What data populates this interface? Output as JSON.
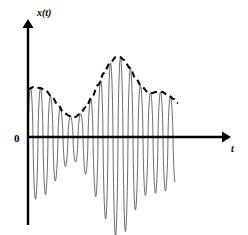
{
  "figure": {
    "title": "",
    "background_color": "#ffffff",
    "width": 248,
    "height": 235
  },
  "axes": {
    "y_axis_label": "x(t)",
    "x_axis_label": "t",
    "origin_label": "0",
    "axis_color": "#000000",
    "origin_px": {
      "x": 28,
      "y": 137
    },
    "x_axis_end_px": 228,
    "y_axis_top_px": 22,
    "y_axis_bottom_px": 225
  },
  "series": {
    "carrier_name": "oscillating-signal",
    "carrier_color": "#5a5a5a",
    "envelope_name": "amplitude-envelope",
    "envelope_color": "#000000",
    "envelope_style": "dashed"
  },
  "chart_data": {
    "type": "line",
    "title": "",
    "xlabel": "t",
    "ylabel": "x(t)",
    "grid": false,
    "legend": "none",
    "xlim": [
      0,
      148
    ],
    "ylim": [
      -90,
      90
    ],
    "series": [
      {
        "name": "envelope",
        "style": "dashed",
        "color": "#000000",
        "comment": "Upper envelope control points in data coords (t, amplitude)",
        "x": [
          0,
          6,
          12,
          18,
          24,
          30,
          36,
          42,
          47,
          52,
          58,
          64,
          70,
          76,
          82,
          88,
          92,
          96,
          102,
          108,
          114,
          120,
          124,
          128,
          134,
          140,
          146,
          150
        ],
        "values": [
          48,
          50,
          49,
          46,
          40,
          32,
          24,
          21,
          20,
          23,
          30,
          40,
          52,
          64,
          74,
          80,
          80,
          77,
          69,
          58,
          50,
          45,
          44,
          45,
          45,
          42,
          38,
          34
        ]
      },
      {
        "name": "carrier",
        "style": "solid",
        "color": "#5a5a5a",
        "comment": "x(t) = envelope(t) * sin(2*pi*t/10), asymmetric with deeper negative excursions",
        "carrier_period": 10,
        "negative_gain": 1.25,
        "t_start": 0,
        "t_end": 147
      }
    ]
  }
}
